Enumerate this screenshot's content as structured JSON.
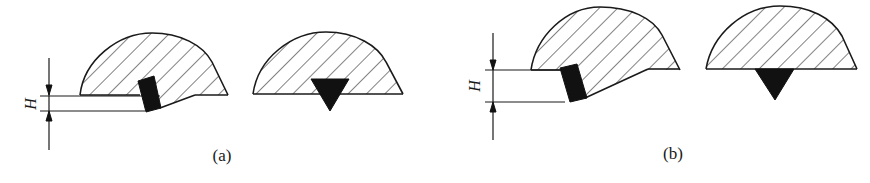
{
  "figure": {
    "type": "weld-bead cross-section schematic",
    "panels": [
      {
        "id": "a",
        "caption": "(a)",
        "dimension_label": "H",
        "description": "Small height offset H: bead on plate with electrode/wire at edge; alternative shows triangular penetration centered under bead"
      },
      {
        "id": "b",
        "caption": "(b)",
        "dimension_label": "H",
        "description": "Larger height offset H: bead edge slopes down further; alternative shows triangular penetration below bead"
      }
    ]
  },
  "colors": {
    "line": "#1a1a1a",
    "fill_solid": "#111111",
    "background": "#ffffff"
  }
}
